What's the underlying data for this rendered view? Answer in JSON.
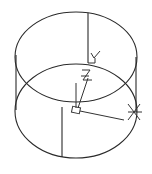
{
  "figure": {
    "background": "#ffffff",
    "line_color": "#2a2a2a"
  },
  "cylinder": {
    "top_ellipse": {
      "cx": 76,
      "cy": 57,
      "rx": 61,
      "ry": 45
    },
    "bottom_ellipse": {
      "cx": 76,
      "cy": 111,
      "rx": 61,
      "ry": 47
    },
    "left_edge_x": 16,
    "right_edge_x": 136
  },
  "ucs_icon": {
    "labels": {
      "x": "X",
      "y": "Y",
      "z": "Z"
    }
  }
}
